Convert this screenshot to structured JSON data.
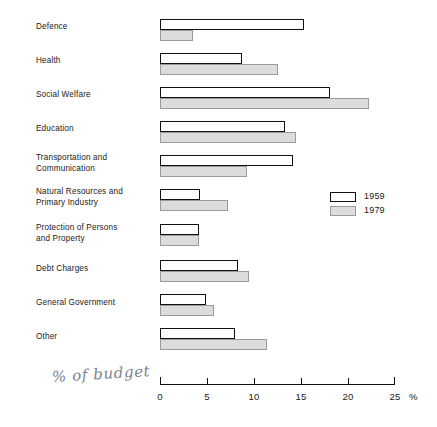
{
  "chart_data": {
    "type": "bar",
    "orientation": "horizontal",
    "title": "",
    "xlabel": "% of budget",
    "ylabel": "",
    "xlim": [
      0,
      25
    ],
    "xticks": [
      0,
      5,
      10,
      15,
      20,
      25
    ],
    "xtick_labels": [
      "0",
      "5",
      "10",
      "15",
      "20",
      "25"
    ],
    "axis_unit": "%",
    "grid": false,
    "legend_position": "middle-right",
    "categories": [
      "Defence",
      "Health",
      "Social Welfare",
      "Education",
      "Transportation and\nCommunication",
      "Natural Resources and\nPrimary Industry",
      "Protection of Persons\nand Property",
      "Debt Charges",
      "General Government",
      "Other"
    ],
    "series": [
      {
        "name": "1959",
        "values": [
          15.4,
          8.7,
          18.1,
          13.3,
          14.2,
          4.3,
          4.2,
          8.3,
          4.9,
          8.0
        ]
      },
      {
        "name": "1979",
        "values": [
          3.5,
          12.6,
          22.3,
          14.5,
          9.3,
          7.2,
          4.2,
          9.5,
          5.8,
          11.4
        ]
      }
    ],
    "colors": {
      "series_1959_fill": "#ffffff",
      "series_1959_border": "#111111",
      "series_1979_fill": "#dcdcdc",
      "series_1979_border": "#9a9a9a",
      "axis": "#111111",
      "text": "#1a1a1a",
      "annotation": "#7b8391"
    }
  },
  "legend": {
    "entries": [
      {
        "label": "1959"
      },
      {
        "label": "1979"
      }
    ]
  },
  "annotation": {
    "handwritten_note": "% of budget"
  }
}
